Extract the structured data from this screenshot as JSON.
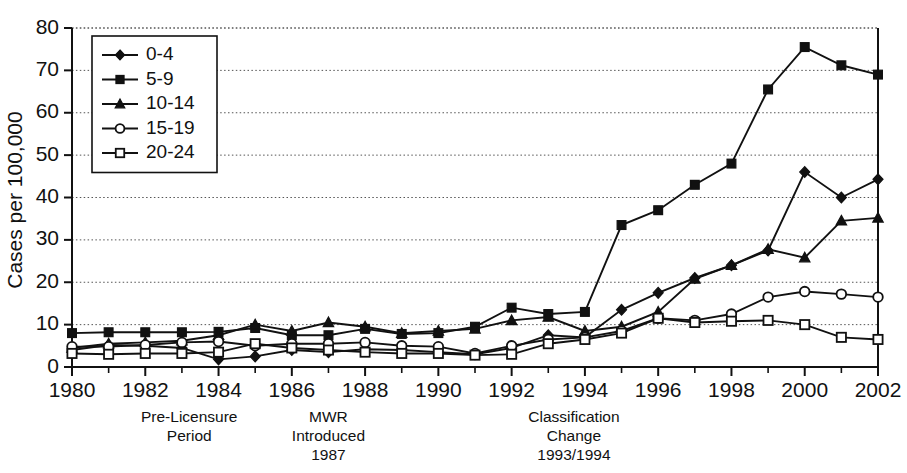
{
  "chart_data": {
    "type": "line",
    "title": "",
    "xlabel": "",
    "ylabel": "Cases per 100,000",
    "xlim": [
      1980,
      2002
    ],
    "ylim": [
      0,
      80
    ],
    "ytick_step": 10,
    "xtick_step": 2,
    "grid": true,
    "legend_position": "top-left",
    "x": [
      1980,
      1981,
      1982,
      1983,
      1984,
      1985,
      1986,
      1987,
      1988,
      1989,
      1990,
      1991,
      1992,
      1993,
      1994,
      1995,
      1996,
      1997,
      1998,
      1999,
      2000,
      2001,
      2002
    ],
    "xticks": [
      "1980",
      "1982",
      "1984",
      "1986",
      "1988",
      "1990",
      "1992",
      "1994",
      "1996",
      "1998",
      "2000",
      "2002"
    ],
    "yticks": [
      "0",
      "10",
      "20",
      "30",
      "40",
      "50",
      "60",
      "70",
      "80"
    ],
    "series": [
      {
        "name": "0-4",
        "marker": "filled-diamond",
        "values": [
          4.0,
          5.2,
          5.0,
          4.5,
          1.8,
          2.5,
          4.0,
          3.5,
          4.2,
          4.0,
          3.5,
          3.0,
          4.5,
          7.5,
          7.0,
          13.5,
          17.5,
          21.0,
          24.0,
          27.5,
          46.0,
          40.0,
          44.3
        ]
      },
      {
        "name": "5-9",
        "marker": "filled-square",
        "values": [
          8.0,
          8.2,
          8.2,
          8.2,
          8.3,
          9.2,
          7.5,
          7.5,
          9.0,
          7.8,
          8.0,
          9.5,
          14.0,
          12.5,
          13.0,
          33.5,
          37.0,
          43.0,
          48.0,
          65.5,
          75.5,
          71.2,
          69.0
        ]
      },
      {
        "name": "10-14",
        "marker": "filled-triangle",
        "values": [
          4.5,
          5.5,
          5.8,
          6.2,
          7.5,
          10.0,
          8.5,
          10.5,
          9.5,
          8.0,
          8.5,
          9.0,
          11.0,
          11.8,
          8.5,
          9.5,
          13.0,
          20.8,
          24.0,
          27.8,
          25.8,
          34.5,
          35.2
        ]
      },
      {
        "name": "15-19",
        "marker": "open-circle",
        "values": [
          4.8,
          4.8,
          5.2,
          5.8,
          6.0,
          5.0,
          5.5,
          5.5,
          5.8,
          5.0,
          4.8,
          3.2,
          5.0,
          6.5,
          7.0,
          8.5,
          11.5,
          11.0,
          12.5,
          16.5,
          17.8,
          17.2,
          16.5
        ]
      },
      {
        "name": "20-24",
        "marker": "open-square",
        "values": [
          3.2,
          3.0,
          3.2,
          3.2,
          3.5,
          5.5,
          4.5,
          4.0,
          3.5,
          3.2,
          3.2,
          2.8,
          3.0,
          5.5,
          6.5,
          8.0,
          11.5,
          10.5,
          10.8,
          11.0,
          10.0,
          7.0,
          6.5
        ]
      }
    ],
    "annotations": [
      {
        "id": "pre-licensure",
        "x": 1983.2,
        "lines": [
          "Pre-Licensure",
          "Period"
        ]
      },
      {
        "id": "mwr-introduced",
        "x": 1987.0,
        "lines": [
          "MWR",
          "Introduced",
          "1987"
        ]
      },
      {
        "id": "classification-change",
        "x": 1993.7,
        "lines": [
          "Classification",
          "Change",
          "1993/1994"
        ]
      }
    ]
  }
}
